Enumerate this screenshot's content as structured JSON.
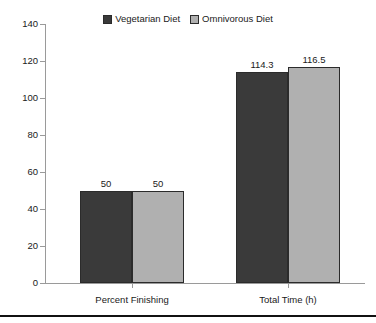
{
  "chart_data": {
    "type": "bar",
    "title": "",
    "subtitle": "",
    "xlabel": "",
    "ylabel": "",
    "categories": [
      "Percent Finishing",
      "Total Time (h)"
    ],
    "series": [
      {
        "name": "Vegetarian Diet",
        "color": "#3a3a3a",
        "values": [
          50,
          114.3
        ],
        "value_labels": [
          "50",
          "114.3"
        ]
      },
      {
        "name": "Omnivorous Diet",
        "color": "#b0b0b0",
        "values": [
          50,
          116.5
        ],
        "value_labels": [
          "50",
          "116.5"
        ]
      }
    ],
    "ylim": [
      0,
      140
    ],
    "ytick_step": 20,
    "ytick_labels": [
      "0",
      "20",
      "40",
      "60",
      "80",
      "100",
      "120",
      "140"
    ],
    "ytick_values": [
      0,
      20,
      40,
      60,
      80,
      100,
      120,
      140
    ],
    "grid": false,
    "legend_position": "top-center",
    "axis_color": "#9a9a9a",
    "bar_edge_color": "#2b2b2b",
    "background": "#ffffff"
  },
  "legend": {
    "entries": [
      {
        "label": "Vegetarian Diet",
        "swatch": "legend-swatch-vegetarian"
      },
      {
        "label": "Omnivorous Diet",
        "swatch": "legend-swatch-omnivorous"
      }
    ]
  },
  "footer": {
    "rule_color": "#111111"
  }
}
